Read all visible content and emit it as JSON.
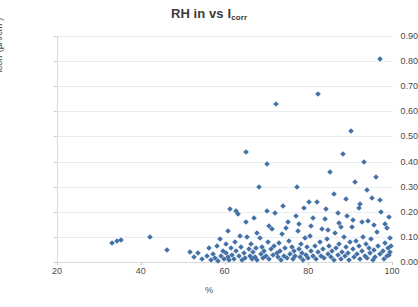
{
  "chart_data": {
    "type": "scatter",
    "title": "RH in vs I",
    "title_sub": "corr",
    "xlabel": "%",
    "ylabel": "icorr (µA/cm²)",
    "xlim": [
      20,
      100
    ],
    "ylim": [
      0.0,
      0.9
    ],
    "xticks": [
      20,
      40,
      60,
      80,
      100
    ],
    "xtick_labels": [
      "20",
      "40",
      "60",
      "80",
      "100"
    ],
    "yticks": [
      0.0,
      0.1,
      0.2,
      0.3,
      0.4,
      0.5,
      0.6,
      0.7,
      0.8,
      0.9
    ],
    "ytick_labels": [
      "0.00",
      "0.10",
      "0.20",
      "0.30",
      "0.40",
      "0.50",
      "0.60",
      "0.70",
      "0.80",
      "0.90"
    ],
    "grid": true,
    "grid_axis": "y",
    "legend": false,
    "marker": "diamond",
    "marker_color": "#4472a8",
    "series": [
      {
        "name": "Icorr vs RH",
        "points": [
          [
            33.0,
            0.075
          ],
          [
            34.2,
            0.082
          ],
          [
            35.0,
            0.088
          ],
          [
            42.0,
            0.1
          ],
          [
            46.0,
            0.048
          ],
          [
            51.5,
            0.04
          ],
          [
            52.5,
            0.018
          ],
          [
            53.5,
            0.035
          ],
          [
            54.5,
            0.012
          ],
          [
            55.5,
            0.022
          ],
          [
            56.0,
            0.055
          ],
          [
            56.5,
            0.008
          ],
          [
            57.0,
            0.03
          ],
          [
            57.5,
            0.015
          ],
          [
            58.0,
            0.062
          ],
          [
            58.3,
            0.005
          ],
          [
            58.6,
            0.09
          ],
          [
            59.0,
            0.025
          ],
          [
            59.3,
            0.045
          ],
          [
            59.6,
            0.01
          ],
          [
            60.0,
            0.035
          ],
          [
            60.2,
            0.07
          ],
          [
            60.5,
            0.018
          ],
          [
            60.8,
            0.007
          ],
          [
            61.0,
            0.21
          ],
          [
            61.3,
            0.055
          ],
          [
            61.6,
            0.028
          ],
          [
            62.0,
            0.012
          ],
          [
            62.3,
            0.08
          ],
          [
            62.6,
            0.042
          ],
          [
            63.0,
            0.19
          ],
          [
            63.3,
            0.022
          ],
          [
            63.6,
            0.06
          ],
          [
            64.0,
            0.008
          ],
          [
            64.3,
            0.035
          ],
          [
            64.6,
            0.015
          ],
          [
            65.0,
            0.44
          ],
          [
            65.2,
            0.1
          ],
          [
            65.5,
            0.05
          ],
          [
            65.8,
            0.025
          ],
          [
            66.0,
            0.07
          ],
          [
            66.3,
            0.012
          ],
          [
            66.6,
            0.038
          ],
          [
            67.0,
            0.018
          ],
          [
            67.3,
            0.055
          ],
          [
            67.6,
            0.008
          ],
          [
            68.0,
            0.3
          ],
          [
            68.2,
            0.095
          ],
          [
            68.5,
            0.03
          ],
          [
            68.8,
            0.06
          ],
          [
            69.0,
            0.015
          ],
          [
            69.3,
            0.045
          ],
          [
            69.6,
            0.022
          ],
          [
            70.0,
            0.39
          ],
          [
            70.2,
            0.08
          ],
          [
            70.5,
            0.01
          ],
          [
            70.8,
            0.05
          ],
          [
            71.0,
            0.13
          ],
          [
            71.3,
            0.028
          ],
          [
            71.6,
            0.065
          ],
          [
            72.0,
            0.63
          ],
          [
            72.2,
            0.035
          ],
          [
            72.5,
            0.018
          ],
          [
            72.8,
            0.075
          ],
          [
            73.0,
            0.045
          ],
          [
            73.3,
            0.008
          ],
          [
            73.6,
            0.11
          ],
          [
            74.0,
            0.025
          ],
          [
            74.3,
            0.055
          ],
          [
            74.6,
            0.015
          ],
          [
            75.0,
            0.16
          ],
          [
            75.2,
            0.085
          ],
          [
            75.5,
            0.032
          ],
          [
            75.8,
            0.06
          ],
          [
            76.0,
            0.012
          ],
          [
            76.3,
            0.042
          ],
          [
            76.6,
            0.022
          ],
          [
            77.0,
            0.3
          ],
          [
            77.2,
            0.125
          ],
          [
            77.5,
            0.05
          ],
          [
            77.8,
            0.018
          ],
          [
            78.0,
            0.07
          ],
          [
            78.3,
            0.035
          ],
          [
            78.6,
            0.008
          ],
          [
            79.0,
            0.095
          ],
          [
            79.2,
            0.028
          ],
          [
            79.5,
            0.058
          ],
          [
            79.8,
            0.015
          ],
          [
            80.0,
            0.24
          ],
          [
            80.2,
            0.105
          ],
          [
            80.5,
            0.045
          ],
          [
            80.8,
            0.022
          ],
          [
            81.0,
            0.175
          ],
          [
            81.3,
            0.065
          ],
          [
            81.6,
            0.01
          ],
          [
            82.0,
            0.67
          ],
          [
            82.2,
            0.038
          ],
          [
            82.5,
            0.08
          ],
          [
            82.8,
            0.025
          ],
          [
            83.0,
            0.13
          ],
          [
            83.3,
            0.052
          ],
          [
            83.6,
            0.016
          ],
          [
            84.0,
            0.21
          ],
          [
            84.2,
            0.09
          ],
          [
            84.5,
            0.032
          ],
          [
            84.8,
            0.062
          ],
          [
            85.0,
            0.36
          ],
          [
            85.2,
            0.018
          ],
          [
            85.5,
            0.045
          ],
          [
            85.8,
            0.008
          ],
          [
            86.0,
            0.27
          ],
          [
            86.2,
            0.115
          ],
          [
            86.5,
            0.055
          ],
          [
            86.8,
            0.028
          ],
          [
            87.0,
            0.155
          ],
          [
            87.2,
            0.072
          ],
          [
            87.5,
            0.012
          ],
          [
            87.8,
            0.04
          ],
          [
            88.0,
            0.43
          ],
          [
            88.2,
            0.098
          ],
          [
            88.5,
            0.022
          ],
          [
            88.8,
            0.06
          ],
          [
            89.0,
            0.185
          ],
          [
            89.2,
            0.035
          ],
          [
            89.5,
            0.008
          ],
          [
            89.8,
            0.078
          ],
          [
            90.0,
            0.52
          ],
          [
            90.2,
            0.14
          ],
          [
            90.5,
            0.05
          ],
          [
            90.8,
            0.018
          ],
          [
            91.0,
            0.32
          ],
          [
            91.2,
            0.085
          ],
          [
            91.5,
            0.03
          ],
          [
            91.8,
            0.062
          ],
          [
            92.0,
            0.23
          ],
          [
            92.2,
            0.012
          ],
          [
            92.5,
            0.045
          ],
          [
            92.8,
            0.1
          ],
          [
            93.0,
            0.4
          ],
          [
            93.2,
            0.025
          ],
          [
            93.5,
            0.07
          ],
          [
            93.8,
            0.015
          ],
          [
            94.0,
            0.165
          ],
          [
            94.2,
            0.055
          ],
          [
            94.5,
            0.035
          ],
          [
            94.8,
            0.09
          ],
          [
            95.0,
            0.255
          ],
          [
            95.2,
            0.008
          ],
          [
            95.5,
            0.048
          ],
          [
            95.8,
            0.02
          ],
          [
            96.0,
            0.34
          ],
          [
            96.2,
            0.12
          ],
          [
            96.5,
            0.065
          ],
          [
            96.8,
            0.03
          ],
          [
            97.0,
            0.81
          ],
          [
            97.2,
            0.2
          ],
          [
            97.5,
            0.042
          ],
          [
            97.8,
            0.01
          ],
          [
            98.0,
            0.15
          ],
          [
            98.2,
            0.075
          ],
          [
            98.5,
            0.025
          ],
          [
            98.8,
            0.055
          ],
          [
            99.0,
            0.18
          ],
          [
            99.2,
            0.038
          ],
          [
            99.4,
            0.095
          ],
          [
            62.5,
            0.205
          ],
          [
            64.8,
            0.16
          ],
          [
            66.8,
            0.175
          ],
          [
            69.8,
            0.205
          ],
          [
            71.8,
            0.195
          ],
          [
            73.8,
            0.225
          ],
          [
            76.8,
            0.185
          ],
          [
            78.8,
            0.215
          ],
          [
            81.8,
            0.24
          ],
          [
            83.8,
            0.17
          ],
          [
            86.8,
            0.195
          ],
          [
            88.8,
            0.25
          ],
          [
            91.8,
            0.215
          ],
          [
            93.8,
            0.285
          ],
          [
            96.8,
            0.245
          ],
          [
            60.5,
            0.125
          ],
          [
            63.5,
            0.105
          ],
          [
            67.5,
            0.115
          ],
          [
            70.5,
            0.145
          ],
          [
            74.5,
            0.135
          ],
          [
            77.5,
            0.152
          ],
          [
            80.5,
            0.142
          ],
          [
            84.5,
            0.128
          ],
          [
            87.5,
            0.138
          ],
          [
            90.5,
            0.168
          ],
          [
            92.5,
            0.158
          ],
          [
            95.5,
            0.148
          ],
          [
            98.5,
            0.135
          ],
          [
            99.5,
            0.062
          ],
          [
            99.0,
            0.028
          ]
        ]
      }
    ]
  }
}
